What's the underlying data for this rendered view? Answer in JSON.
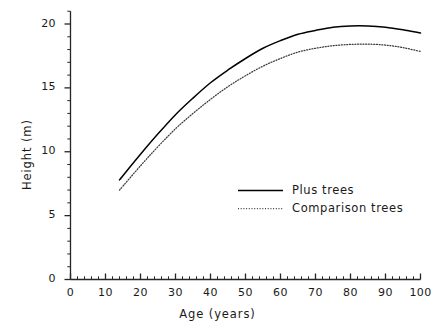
{
  "chart_data": {
    "type": "line",
    "title": "",
    "xlabel": "Age (years)",
    "ylabel": "Height (m)",
    "xlim": [
      0,
      100
    ],
    "ylim": [
      0,
      21
    ],
    "grid": false,
    "legend_position": "center-right-inside",
    "x_ticks_major": [
      0,
      10,
      20,
      30,
      40,
      50,
      60,
      70,
      80,
      90,
      100
    ],
    "x_tick_labels": [
      "0",
      "10",
      "20",
      "30",
      "40",
      "50",
      "60",
      "70",
      "80",
      "90",
      "100"
    ],
    "x_minor_step": 2,
    "y_ticks_major": [
      0,
      5,
      10,
      15,
      20
    ],
    "y_tick_labels": [
      "0",
      "5",
      "10",
      "15",
      "20"
    ],
    "y_minor_step": 1,
    "series": [
      {
        "name": "Plus trees",
        "style": "solid",
        "color": "#000000",
        "x": [
          14,
          20,
          25,
          30,
          35,
          40,
          45,
          50,
          55,
          60,
          65,
          70,
          75,
          80,
          85,
          90,
          95,
          100
        ],
        "values": [
          7.8,
          9.8,
          11.4,
          12.9,
          14.2,
          15.4,
          16.4,
          17.3,
          18.1,
          18.7,
          19.2,
          19.5,
          19.75,
          19.85,
          19.85,
          19.75,
          19.55,
          19.3
        ]
      },
      {
        "name": "Comparison trees",
        "style": "dotted",
        "color": "#3a3a3a",
        "x": [
          14,
          20,
          25,
          30,
          35,
          40,
          45,
          50,
          55,
          60,
          65,
          70,
          75,
          80,
          85,
          90,
          95,
          100
        ],
        "values": [
          7.0,
          8.9,
          10.4,
          11.8,
          13.0,
          14.1,
          15.1,
          15.95,
          16.7,
          17.3,
          17.8,
          18.1,
          18.3,
          18.4,
          18.42,
          18.35,
          18.15,
          17.85
        ]
      }
    ]
  },
  "legend": {
    "entries": [
      {
        "label": "Plus trees",
        "style": "solid"
      },
      {
        "label": "Comparison trees",
        "style": "dotted"
      }
    ]
  },
  "colors": {
    "axis": "#262626",
    "plus_trees": "#000000",
    "comparison_trees": "#3a3a3a",
    "background": "#ffffff",
    "text": "#1a1a1a"
  }
}
